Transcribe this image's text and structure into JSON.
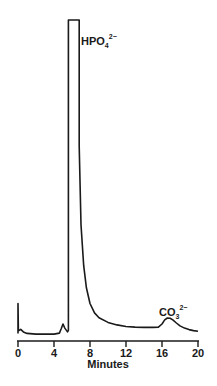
{
  "chart_data": {
    "type": "line",
    "title": "",
    "xlabel": "Minutes",
    "ylabel": "",
    "xlim": [
      0,
      20
    ],
    "ylim": [
      0,
      100
    ],
    "grid": false,
    "legend": null,
    "x_ticks": [
      0,
      4,
      8,
      12,
      16,
      20
    ],
    "x_tick_labels": [
      "0",
      "4",
      "8",
      "12",
      "16",
      "20"
    ],
    "series": [
      {
        "name": "detector signal (relative)",
        "x": [
          0.0,
          0.0,
          0.05,
          0.3,
          0.6,
          1.0,
          2.0,
          3.0,
          4.0,
          4.6,
          4.8,
          5.0,
          5.2,
          5.5,
          5.6,
          5.6,
          6.8,
          6.8,
          7.0,
          7.3,
          7.6,
          8.0,
          8.5,
          9.0,
          10.0,
          11.0,
          12.0,
          13.0,
          14.0,
          15.0,
          15.6,
          16.0,
          16.3,
          16.6,
          16.9,
          17.2,
          17.6,
          18.0,
          18.5,
          19.0,
          19.5,
          20.0
        ],
        "y": [
          0.5,
          10.0,
          1.3,
          1.8,
          1.0,
          0.5,
          0.3,
          0.3,
          0.3,
          0.6,
          2.0,
          3.5,
          2.2,
          1.0,
          1.5,
          100.0,
          100.0,
          60.0,
          35.0,
          22.0,
          15.0,
          10.0,
          7.0,
          5.5,
          4.0,
          3.2,
          2.7,
          2.5,
          2.4,
          2.4,
          2.5,
          3.5,
          4.8,
          5.4,
          5.3,
          4.8,
          3.8,
          2.9,
          2.2,
          1.7,
          1.4,
          1.2
        ]
      }
    ],
    "annotations": [
      {
        "text": "HPO",
        "subscript": "4",
        "superscript": "2−",
        "x": 7.1,
        "y": 92,
        "note": "off-scale peak"
      },
      {
        "text": "CO",
        "subscript": "3",
        "superscript": "2−",
        "x": 16.0,
        "y": 8.5
      }
    ]
  }
}
